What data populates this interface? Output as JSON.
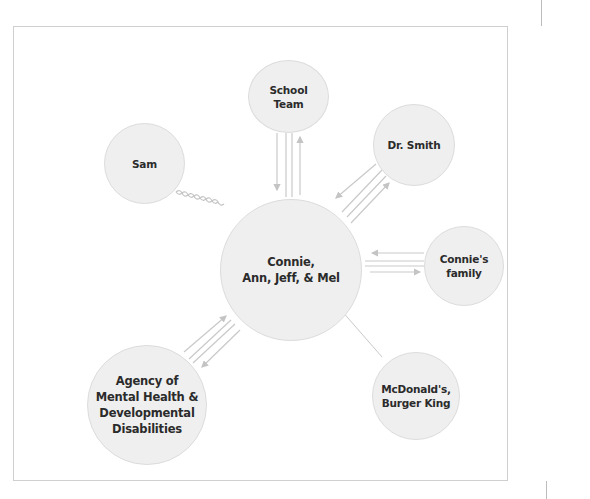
{
  "diagram": {
    "type": "ecomap",
    "center": {
      "id": "center",
      "label": "Connie,\nAnn, Jeff, & Mel"
    },
    "nodes": [
      {
        "id": "school",
        "label": "School\nTeam"
      },
      {
        "id": "sam",
        "label": "Sam"
      },
      {
        "id": "drsmith",
        "label": "Dr. Smith"
      },
      {
        "id": "family",
        "label": "Connie's\nfamily"
      },
      {
        "id": "agency",
        "label": "Agency of\nMental Health &\nDevelopmental\nDisabilities"
      },
      {
        "id": "fastfood",
        "label": "McDonald's,\nBurger King"
      }
    ],
    "edges": [
      {
        "from": "center",
        "to": "school",
        "style": "strong",
        "flow": "bidirectional"
      },
      {
        "from": "center",
        "to": "drsmith",
        "style": "strong",
        "flow": "bidirectional"
      },
      {
        "from": "center",
        "to": "family",
        "style": "strong",
        "flow": "bidirectional"
      },
      {
        "from": "center",
        "to": "agency",
        "style": "strong",
        "flow": "bidirectional"
      },
      {
        "from": "center",
        "to": "sam",
        "style": "stressful",
        "flow": "none"
      },
      {
        "from": "center",
        "to": "fastfood",
        "style": "tenuous",
        "flow": "none"
      }
    ],
    "colors": {
      "node_fill": "#efefef",
      "node_border": "#dcdcdc",
      "line": "#c4c4c4",
      "text": "#2b2b2b"
    }
  }
}
